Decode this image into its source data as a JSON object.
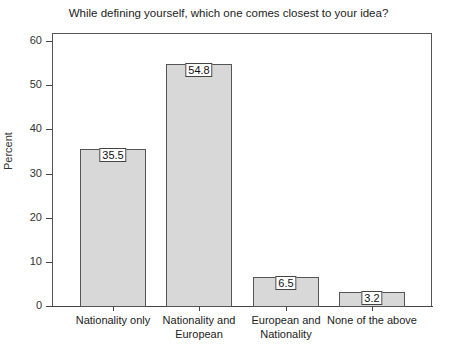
{
  "chart_data": {
    "type": "bar",
    "title": "While defining yourself, which one comes closest to your idea?",
    "xlabel": "",
    "ylabel": "Percent",
    "ylim": [
      0,
      62
    ],
    "yticks": [
      0,
      10,
      20,
      30,
      40,
      50,
      60
    ],
    "grid": false,
    "legend": null,
    "categories": [
      "Nationality only",
      "Nationality and\nEuropean",
      "European and\nNationality",
      "None of the above"
    ],
    "values": [
      35.5,
      54.8,
      6.5,
      3.2
    ],
    "value_labels": [
      "35.5",
      "54.8",
      "6.5",
      "3.2"
    ],
    "bar_color": "#d8d8d8",
    "bar_edge_color": "#555555"
  }
}
